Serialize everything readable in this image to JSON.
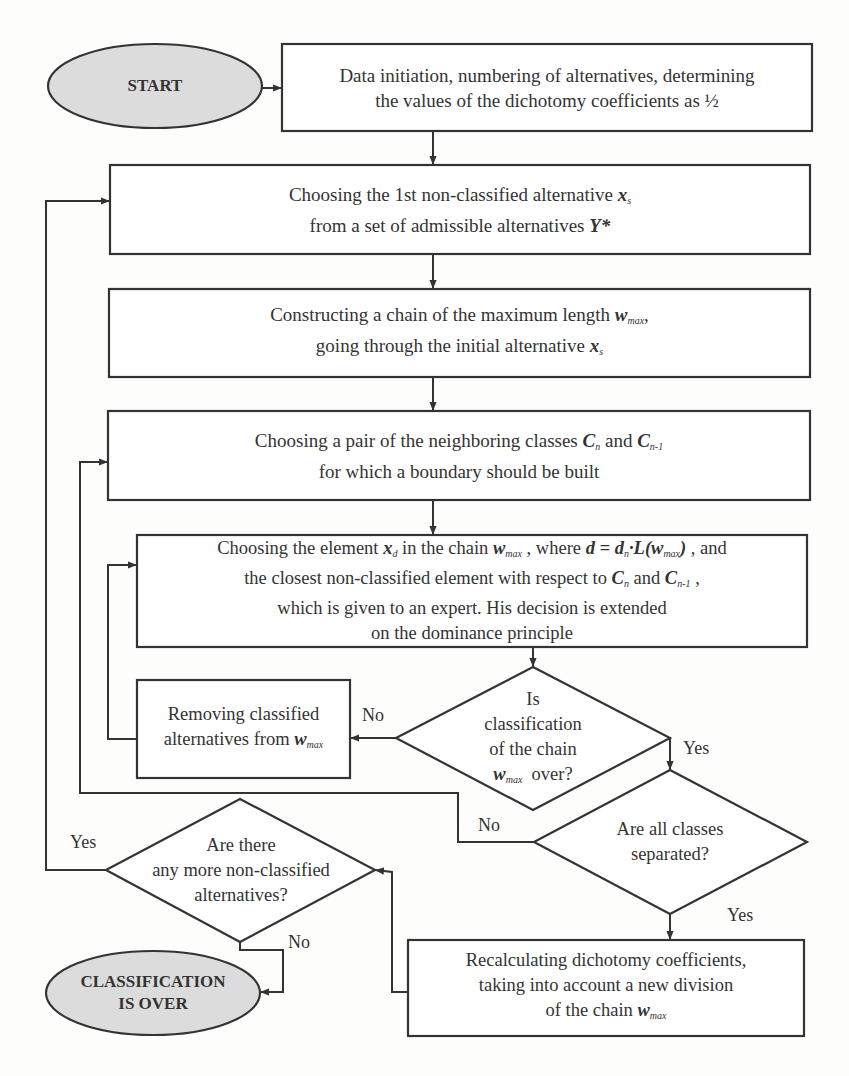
{
  "colors": {
    "stroke": "#333333",
    "terminal_fill": "#dcdcdc",
    "background": "#fdfdfb"
  },
  "terminals": {
    "start": "START",
    "end_line1": "CLASSIFICATION",
    "end_line2": "IS OVER"
  },
  "boxes": {
    "init": {
      "line1": "Data initiation, numbering of alternatives, determining",
      "line2": "the values of the dichotomy coefficients as ½"
    },
    "choose_first": {
      "line1_pre": "Choosing the 1st non-classified alternative ",
      "line1_var": "x",
      "line1_sub": "s",
      "line2_pre": "from a set of admissible alternatives ",
      "line2_var": "Y*"
    },
    "construct_chain": {
      "line1_pre": "Constructing a chain of the maximum length ",
      "line1_var": "w",
      "line1_sub": "max",
      "line1_post": ",",
      "line2_pre": "going through the initial alternative ",
      "line2_var": "x",
      "line2_sub": "s"
    },
    "choose_pair": {
      "line1_pre": "Choosing a pair of the neighboring classes ",
      "var1": "C",
      "sub1": "n",
      "mid": " and ",
      "var2": "C",
      "sub2": "n-1",
      "line2": "for which a boundary should be built"
    },
    "choose_element": {
      "l1_a": "Choosing the element ",
      "l1_x": "x",
      "l1_xsub": "d",
      "l1_b": " in the chain ",
      "l1_w": "w",
      "l1_wsub": "max",
      "l1_c": " , where ",
      "l1_formula": "d = d",
      "l1_fsub": "n",
      "l1_formula2": "·L(w",
      "l1_f2sub": "max",
      "l1_formula3": ")",
      "l1_d": " , and",
      "l2_a": "the closest non-classified element with respect to ",
      "l2_c1": "C",
      "l2_c1sub": "n",
      "l2_and": " and ",
      "l2_c2": "C",
      "l2_c2sub": "n-1",
      "l2_end": " ,",
      "line3": "which is given to an expert. His decision is extended",
      "line4": "on the dominance principle"
    },
    "remove": {
      "line1": "Removing classified",
      "line2_pre": "alternatives from ",
      "line2_var": "w",
      "line2_sub": "max"
    },
    "recalc": {
      "line1": "Recalculating dichotomy coefficients,",
      "line2": "taking into account a new division",
      "line3_pre": "of the chain ",
      "line3_var": "w",
      "line3_sub": "max"
    }
  },
  "decisions": {
    "chain_over": {
      "line1": "Is",
      "line2": "classification",
      "line3": "of the chain",
      "line4_var": "w",
      "line4_sub": "max",
      "line4_post": "  over?"
    },
    "classes_separated": {
      "line1": "Are all classes",
      "line2": "separated?"
    },
    "more_alternatives": {
      "line1": "Are there",
      "line2": "any more non-classified",
      "line3": "alternatives?"
    }
  },
  "edge_labels": {
    "chain_over_no": "No",
    "chain_over_yes": "Yes",
    "separated_no": "No",
    "separated_yes": "Yes",
    "more_yes": "Yes",
    "more_no": "No"
  }
}
